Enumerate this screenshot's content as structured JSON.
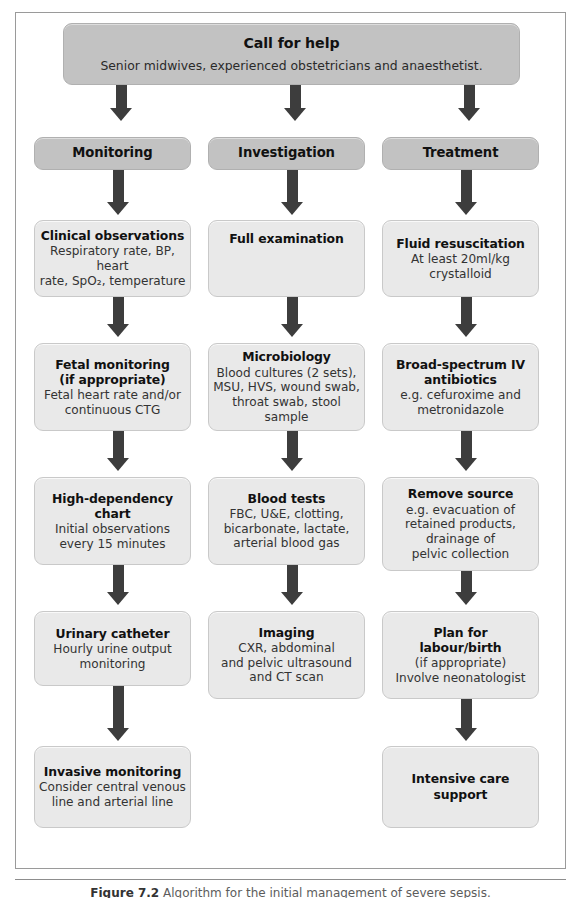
{
  "figure": {
    "caption_label": "Figure 7.2",
    "caption_text": "Algorithm for the initial management of severe sepsis."
  },
  "banner": {
    "title": "Call for help",
    "body": "Senior midwives, experienced obstetricians and anaesthetist."
  },
  "columns": [
    {
      "id": "monitoring",
      "header": "Monitoring",
      "nodes": [
        {
          "title": "Clinical observations",
          "body": "Respiratory rate, BP, heart\nrate, SpO₂, temperature"
        },
        {
          "title": "Fetal monitoring\n(if appropriate)",
          "body": "Fetal heart rate and/or\ncontinuous CTG"
        },
        {
          "title": "High-dependency\nchart",
          "body": "Initial observations\nevery 15 minutes"
        },
        {
          "title": "Urinary catheter",
          "body": "Hourly urine output\nmonitoring"
        },
        {
          "title": "Invasive monitoring",
          "body": "Consider central venous\nline and arterial line"
        }
      ]
    },
    {
      "id": "investigation",
      "header": "Investigation",
      "nodes": [
        {
          "title": "Full examination",
          "body": ""
        },
        {
          "title": "Microbiology",
          "body": "Blood cultures (2 sets),\nMSU, HVS, wound swab,\nthroat swab, stool sample"
        },
        {
          "title": "Blood tests",
          "body": "FBC, U&E, clotting,\nbicarbonate, lactate,\narterial blood gas"
        },
        {
          "title": "Imaging",
          "body": "CXR, abdominal\nand pelvic ultrasound\nand CT scan"
        }
      ]
    },
    {
      "id": "treatment",
      "header": "Treatment",
      "nodes": [
        {
          "title": "Fluid resuscitation",
          "body": "At least 20ml/kg\ncrystalloid"
        },
        {
          "title": "Broad-spectrum IV\nantibiotics",
          "body": "e.g. cefuroxime and\nmetronidazole"
        },
        {
          "title": "Remove source",
          "body": "e.g. evacuation of\nretained products,\ndrainage of\npelvic collection"
        },
        {
          "title": "Plan for\nlabour/birth",
          "body": "(if appropriate)\nInvolve neonatologist"
        },
        {
          "title": "Intensive care\nsupport",
          "body": ""
        }
      ]
    }
  ],
  "colors": {
    "banner_fill": "#c2c2c2",
    "card_fill": "#e9e9e9",
    "arrow_fill": "#3d3d3d",
    "frame_border": "#9a9a9a"
  }
}
